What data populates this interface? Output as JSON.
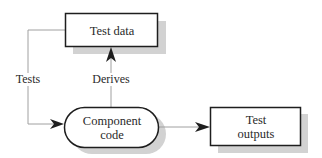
{
  "nodes": {
    "test_data": {
      "label": "Test data"
    },
    "component_code": {
      "line1": "Component",
      "line2": "code"
    },
    "test_outputs": {
      "line1": "Test",
      "line2": "outputs"
    }
  },
  "edges": {
    "tests": {
      "label": "Tests",
      "from": "Test data",
      "to": "Component code"
    },
    "derives": {
      "label": "Derives",
      "from": "Component code",
      "to": "Test data"
    },
    "outputs": {
      "label": "",
      "from": "Component code",
      "to": "Test outputs"
    }
  },
  "colors": {
    "line": "#9a9a9a",
    "border": "#1e1e1e",
    "shadow": "#cfcfcf",
    "text": "#2a2a2a"
  }
}
